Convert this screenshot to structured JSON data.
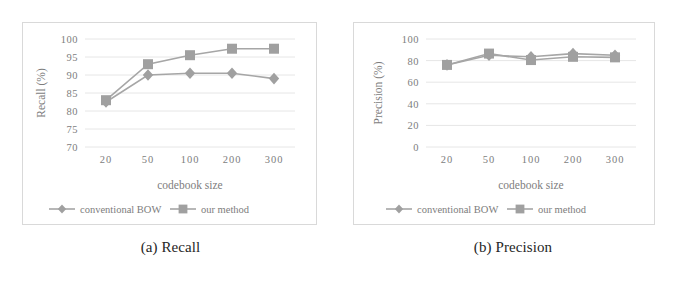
{
  "figure": {
    "panels": [
      {
        "caption": "(a) Recall",
        "name": "recall"
      },
      {
        "caption": "(b) Precision",
        "name": "precision"
      }
    ]
  },
  "legend": {
    "series_a_label": "conventional BOW",
    "series_b_label": "our method",
    "marker_a": "diamond-marker",
    "marker_b": "square-marker"
  },
  "style": {
    "series_color": "#a0a0a0",
    "line_color": "#a6a6a6",
    "grid_color": "#e6e6e6",
    "text_color": "#7d7d7d",
    "box_border": "#d9d9d9"
  },
  "chart_data": [
    {
      "type": "line",
      "title": "(a) Recall",
      "xlabel": "codebook size",
      "ylabel": "Recall (%)",
      "categories": [
        "20",
        "50",
        "100",
        "200",
        "300"
      ],
      "yticks": [
        70,
        75,
        80,
        85,
        90,
        95,
        100
      ],
      "ylim": [
        70,
        100
      ],
      "grid": true,
      "legend_position": "bottom",
      "series": [
        {
          "name": "conventional BOW",
          "marker": "diamond",
          "values": [
            82.5,
            90.0,
            90.5,
            90.5,
            89.0
          ]
        },
        {
          "name": "our method",
          "marker": "square",
          "values": [
            83.0,
            93.0,
            95.5,
            97.3,
            97.3
          ]
        }
      ]
    },
    {
      "type": "line",
      "title": "(b) Precision",
      "xlabel": "codebook size",
      "ylabel": "Precision (%)",
      "categories": [
        "20",
        "50",
        "100",
        "200",
        "300"
      ],
      "yticks": [
        0,
        20,
        40,
        60,
        80,
        100
      ],
      "ylim": [
        0,
        100
      ],
      "grid": true,
      "legend_position": "bottom",
      "series": [
        {
          "name": "conventional BOW",
          "marker": "diamond",
          "values": [
            76.0,
            85.0,
            83.5,
            86.5,
            85.0
          ]
        },
        {
          "name": "our method",
          "marker": "square",
          "values": [
            76.0,
            86.5,
            80.5,
            83.5,
            83.0
          ]
        }
      ]
    }
  ]
}
